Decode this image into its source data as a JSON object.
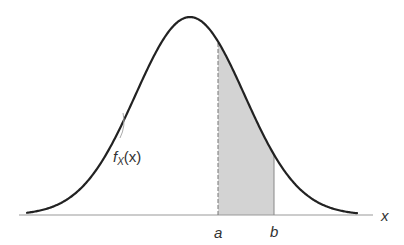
{
  "figure": {
    "curve_label": {
      "func": "f",
      "subscript": "X",
      "arg": "(x)"
    },
    "axis_label": "x",
    "markers": [
      {
        "name": "a",
        "label": "a",
        "line_style": "dashed"
      },
      {
        "name": "b",
        "label": "b",
        "line_style": "solid"
      }
    ],
    "colors": {
      "curve": "#222222",
      "axis": "#999999",
      "shade": "#d3d3d3",
      "shade_edge": "#888888",
      "text": "#333333"
    }
  },
  "chart_data": {
    "type": "area",
    "title": "",
    "xlabel": "x",
    "ylabel": "",
    "curve": "normal density f_X(x)",
    "shaded_interval": [
      "a",
      "b"
    ],
    "tick_labels": [
      "a",
      "b"
    ],
    "annotations": [
      "f_X(x)"
    ],
    "grid": false,
    "legend": "none"
  }
}
